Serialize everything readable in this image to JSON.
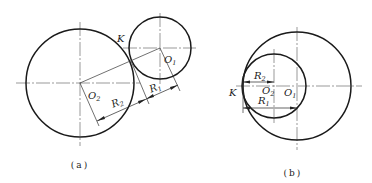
{
  "figure": {
    "a": {
      "caption": "(a)",
      "title": "External tangency",
      "circles": [
        {
          "name": "O2",
          "cx": 80,
          "cy": 83,
          "r": 54
        },
        {
          "name": "O1",
          "cx": 160,
          "cy": 48,
          "r": 31
        }
      ],
      "labels": {
        "K": "K",
        "O1_main": "O",
        "O1_sub": "1",
        "O2_main": "O",
        "O2_sub": "2",
        "R1_main": "R",
        "R1_sub": "1",
        "R2_main": "R",
        "R2_sub": "2"
      }
    },
    "b": {
      "caption": "(b)",
      "title": "Internal tangency",
      "circles": [
        {
          "name": "O1",
          "cx": 297,
          "cy": 86,
          "r": 54
        },
        {
          "name": "O2",
          "cx": 274,
          "cy": 86,
          "r": 32
        }
      ],
      "labels": {
        "K": "K",
        "O1_main": "O",
        "O1_sub": "1",
        "O2_main": "O",
        "O2_sub": "2",
        "R1_main": "R",
        "R1_sub": "1",
        "R2_main": "R",
        "R2_sub": "2"
      }
    }
  }
}
